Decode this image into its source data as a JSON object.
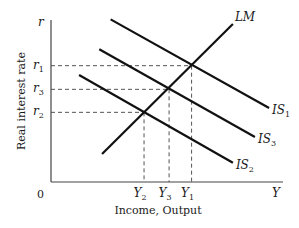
{
  "diagram": {
    "axes": {
      "x_label": "Income, Output",
      "y_label": "Real interest rate",
      "x_symbol": "Y",
      "y_symbol": "r",
      "origin_label": "0",
      "x_range": [
        0,
        10
      ],
      "y_range": [
        0,
        10
      ]
    },
    "curves": [
      {
        "id": "LM",
        "label": "LM",
        "sub": "",
        "from": [
          2.2,
          1.73
        ],
        "to": [
          7.84,
          9.75
        ],
        "label_side": "end-top"
      },
      {
        "id": "IS1",
        "label": "IS",
        "sub": "1",
        "from": [
          2.57,
          10.04
        ],
        "to": [
          9.4,
          4.57
        ],
        "label_side": "end"
      },
      {
        "id": "IS3",
        "label": "IS",
        "sub": "3",
        "from": [
          2.08,
          8.19
        ],
        "to": [
          8.79,
          2.78
        ],
        "label_side": "end"
      },
      {
        "id": "IS2",
        "label": "IS",
        "sub": "2",
        "from": [
          1.21,
          6.6
        ],
        "to": [
          7.84,
          1.19
        ],
        "label_side": "end"
      }
    ],
    "equilibria": [
      {
        "id": "E1",
        "Y": 6.06,
        "r": 7.18,
        "y_tick": "Y",
        "y_sub": "1",
        "r_tick": "r",
        "r_sub": "1"
      },
      {
        "id": "E3",
        "Y": 5.09,
        "r": 5.72,
        "y_tick": "Y",
        "y_sub": "3",
        "r_tick": "r",
        "r_sub": "3"
      },
      {
        "id": "E2",
        "Y": 4.01,
        "r": 4.3,
        "y_tick": "Y",
        "y_sub": "2",
        "r_tick": "r",
        "r_sub": "2"
      }
    ]
  }
}
